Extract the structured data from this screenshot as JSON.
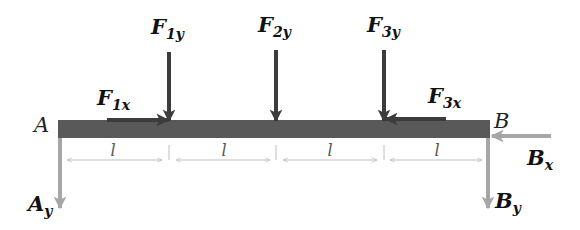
{
  "diagram": {
    "type": "free-body-diagram",
    "colors": {
      "beam": "#595959",
      "applied_force": "#3c3c3c",
      "reaction_force": "#a6a6a6",
      "dimension": "#bfbfbf",
      "label": "#111111"
    },
    "beam": {
      "left_end_label": "A",
      "right_end_label": "B",
      "segments": 4,
      "segment_label": "l"
    },
    "applied_forces": {
      "f1y": {
        "name": "F",
        "sub": "1y"
      },
      "f2y": {
        "name": "F",
        "sub": "2y"
      },
      "f3y": {
        "name": "F",
        "sub": "3y"
      },
      "f1x": {
        "name": "F",
        "sub": "1x"
      },
      "f3x": {
        "name": "F",
        "sub": "3x"
      }
    },
    "reactions": {
      "ay": {
        "name": "A",
        "sub": "y"
      },
      "by": {
        "name": "B",
        "sub": "y"
      },
      "bx": {
        "name": "B",
        "sub": "x"
      }
    },
    "dimensions": [
      "l",
      "l",
      "l",
      "l"
    ]
  }
}
